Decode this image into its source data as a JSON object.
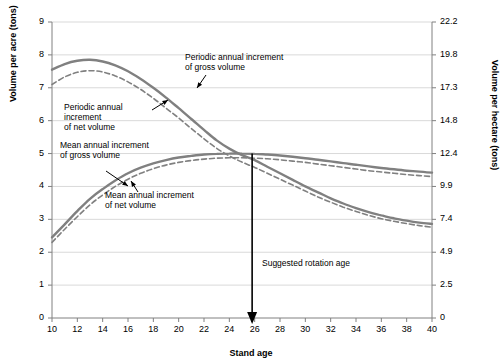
{
  "chart_data": {
    "type": "line",
    "title": "",
    "xlabel": "Stand age",
    "ylabel": "Volume per acre (tons)",
    "ylabel_right": "Volume per hectare (tons)",
    "xlim": [
      10,
      40
    ],
    "ylim": [
      0,
      9
    ],
    "ylim_right": [
      0,
      22.2
    ],
    "xticks": [
      10,
      12,
      14,
      16,
      18,
      20,
      22,
      24,
      26,
      28,
      30,
      32,
      34,
      36,
      38,
      40
    ],
    "yticks": [
      0,
      1,
      2,
      3,
      4,
      5,
      6,
      7,
      8,
      9
    ],
    "yticks_right": [
      "0",
      "2.5",
      "4.9",
      "7.4",
      "9.9",
      "12.4",
      "14.8",
      "17.3",
      "19.8",
      "22.2"
    ],
    "grid": "horizontal",
    "legend_position": "inline-annotations",
    "series": [
      {
        "name": "Periodic annual increment of gross volume",
        "style": "solid",
        "color": "#808080",
        "x": [
          10,
          11,
          12,
          13,
          14,
          15,
          16,
          17,
          18,
          19,
          20,
          21,
          22,
          23,
          24,
          25,
          26,
          27,
          28,
          29,
          30,
          31,
          32,
          33,
          34,
          35,
          36,
          37,
          38,
          39,
          40
        ],
        "values": [
          7.55,
          7.72,
          7.82,
          7.85,
          7.8,
          7.68,
          7.5,
          7.27,
          7.0,
          6.7,
          6.38,
          6.05,
          5.72,
          5.4,
          5.15,
          4.95,
          4.8,
          4.6,
          4.4,
          4.2,
          4.0,
          3.82,
          3.64,
          3.48,
          3.34,
          3.22,
          3.12,
          3.03,
          2.96,
          2.9,
          2.86
        ]
      },
      {
        "name": "Periodic annual increment of net volume",
        "style": "dashed",
        "color": "#808080",
        "x": [
          10,
          11,
          12,
          13,
          14,
          15,
          16,
          17,
          18,
          19,
          20,
          21,
          22,
          23,
          24,
          25,
          26,
          27,
          28,
          29,
          30,
          31,
          32,
          33,
          34,
          35,
          36,
          37,
          38,
          39,
          40
        ],
        "values": [
          7.1,
          7.33,
          7.47,
          7.52,
          7.48,
          7.36,
          7.18,
          6.95,
          6.68,
          6.38,
          6.08,
          5.76,
          5.45,
          5.16,
          4.93,
          4.74,
          4.58,
          4.4,
          4.22,
          4.04,
          3.86,
          3.68,
          3.52,
          3.37,
          3.24,
          3.12,
          3.02,
          2.94,
          2.87,
          2.81,
          2.76
        ]
      },
      {
        "name": "Mean annual increment of gross volume",
        "style": "solid",
        "color": "#808080",
        "x": [
          10,
          11,
          12,
          13,
          14,
          15,
          16,
          17,
          18,
          19,
          20,
          21,
          22,
          23,
          24,
          25,
          26,
          27,
          28,
          29,
          30,
          31,
          32,
          33,
          34,
          35,
          36,
          37,
          38,
          39,
          40
        ],
        "values": [
          2.45,
          2.85,
          3.25,
          3.62,
          3.92,
          4.18,
          4.4,
          4.57,
          4.7,
          4.8,
          4.88,
          4.93,
          4.97,
          4.99,
          5.0,
          5.0,
          4.99,
          4.97,
          4.94,
          4.9,
          4.86,
          4.81,
          4.76,
          4.71,
          4.66,
          4.61,
          4.56,
          4.52,
          4.48,
          4.45,
          4.42
        ]
      },
      {
        "name": "Mean annual increment of net volume",
        "style": "dashed",
        "color": "#808080",
        "x": [
          10,
          11,
          12,
          13,
          14,
          15,
          16,
          17,
          18,
          19,
          20,
          21,
          22,
          23,
          24,
          25,
          26,
          27,
          28,
          29,
          30,
          31,
          32,
          33,
          34,
          35,
          36,
          37,
          38,
          39,
          40
        ],
        "values": [
          2.3,
          2.7,
          3.08,
          3.44,
          3.74,
          4.0,
          4.22,
          4.4,
          4.54,
          4.65,
          4.73,
          4.79,
          4.83,
          4.86,
          4.87,
          4.87,
          4.86,
          4.84,
          4.81,
          4.77,
          4.73,
          4.68,
          4.63,
          4.58,
          4.53,
          4.48,
          4.44,
          4.4,
          4.36,
          4.33,
          4.3
        ]
      }
    ],
    "annotations": [
      {
        "name": "pai-gross-label",
        "text": "Periodic annual increment\nof gross volume",
        "x": 26,
        "y": 8.2
      },
      {
        "name": "pai-net-label",
        "text": "Periodic annual\nincrement\nof net volume",
        "x": 13.5,
        "y": 6.9
      },
      {
        "name": "mai-gross-label",
        "text": "Mean annual increment\nof gross volume",
        "x": 11.5,
        "y": 5.5
      },
      {
        "name": "mai-net-label",
        "text": "Mean annual increment\nof net volume",
        "x": 15.5,
        "y": 3.6
      },
      {
        "name": "rotation-age-label",
        "text": "Suggested rotation age",
        "x": 27,
        "y": 1.9
      }
    ],
    "marker": {
      "name": "rotation-age-arrow",
      "x": 25.8,
      "y_top": 5.0,
      "y_bottom": 0.0
    }
  }
}
